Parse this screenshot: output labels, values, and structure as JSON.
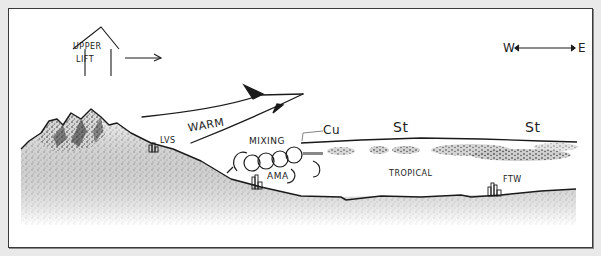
{
  "diagram": {
    "type": "hand-drawn meteorological cross-section sketch",
    "labels": {
      "upper_lift_line1": "UPPER",
      "upper_lift_line2": "LIFT",
      "compass_west": "W",
      "compass_east": "E",
      "warm": "WARM",
      "lvs": "LVS",
      "mixing": "MIXING",
      "cu": "Cu",
      "stratus_left": "St",
      "stratus_right": "St",
      "ama": "AMA",
      "tropical": "TROPICAL",
      "ftw": "FTW"
    },
    "elements": [
      {
        "name": "upper-lift-symbol",
        "description": "house-shaped outline containing UPPER LIFT with arrow pointing east"
      },
      {
        "name": "compass",
        "description": "double-headed arrow between W and E"
      },
      {
        "name": "warm-air-arrow",
        "description": "large arrow rising from west toward east labeled WARM"
      },
      {
        "name": "mountains",
        "description": "shaded mountain range on the west side"
      },
      {
        "name": "city-lvs",
        "description": "small building cluster on the slope labeled LVS"
      },
      {
        "name": "city-ama",
        "description": "building cluster at mixing zone labeled AMA"
      },
      {
        "name": "city-ftw",
        "description": "building cluster on the east plain labeled FTW"
      },
      {
        "name": "mixing-eddies",
        "description": "circular turbulence eddies labeled MIXING"
      },
      {
        "name": "tropical-layer",
        "description": "moist tropical air layer capped by stratus clouds"
      }
    ],
    "colors": {
      "ink": "#222222",
      "background": "#ffffff",
      "outer": "#e9e9e9",
      "shading": "#6a6a6a"
    }
  }
}
